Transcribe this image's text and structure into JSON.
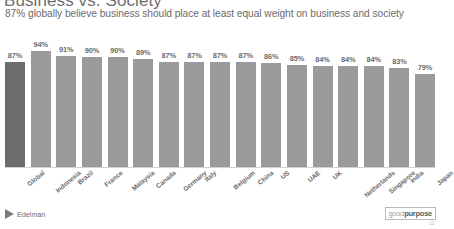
{
  "header": {
    "title": "Business vs. Society",
    "subtitle": "87% globally believe business should place at least equal weight on business and society"
  },
  "footer": {
    "edelman_wordmark": "Edelman",
    "edelman_arrow_icon": "arrow-right-icon",
    "goodpurpose_good": "good",
    "goodpurpose_purpose": "purpose",
    "page_number": "12"
  },
  "colors": {
    "bar_default": "#9a9a9c",
    "bar_highlight": "#6d6d6f",
    "axis_line": "#d2d2d4",
    "text": "#6a6a6c"
  },
  "chart_data": {
    "type": "bar",
    "title": "Business vs. Society",
    "subtitle": "87% globally believe business should place at least equal weight on business and society",
    "xlabel": "",
    "ylabel": "",
    "ylim": [
      0,
      100
    ],
    "grid": false,
    "legend": "none",
    "highlight_category": "Global",
    "categories": [
      "Global",
      "Indonesia",
      "Brazil",
      "France",
      "Malaysia",
      "Canada",
      "Germany",
      "Italy",
      "Belgium",
      "China",
      "US",
      "UAE",
      "UK",
      "Netherlands",
      "Singapore",
      "India",
      "Japan"
    ],
    "values": [
      87,
      94,
      91,
      90,
      90,
      89,
      87,
      87,
      87,
      87,
      86,
      85,
      84,
      84,
      84,
      83,
      79
    ],
    "value_labels": [
      "87%",
      "94%",
      "91%",
      "90%",
      "90%",
      "89%",
      "87%",
      "87%",
      "87%",
      "87%",
      "86%",
      "85%",
      "84%",
      "84%",
      "84%",
      "83%",
      "79%"
    ]
  }
}
